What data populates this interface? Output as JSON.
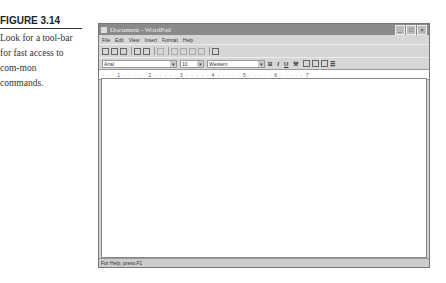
{
  "caption": {
    "title": "FIGURE 3.14",
    "text": "Look for a tool-bar for fast access to com-mon commands."
  },
  "window": {
    "title": "Document - WordPad",
    "controls": [
      "minimize",
      "maximize",
      "close"
    ],
    "menu": [
      "File",
      "Edit",
      "View",
      "Insert",
      "Format",
      "Help"
    ],
    "toolbar_icons": [
      "new-icon",
      "open-icon",
      "save-icon",
      "print-icon",
      "print-preview-icon",
      "find-icon",
      "cut-icon",
      "copy-icon",
      "paste-icon",
      "undo-icon",
      "date-time-icon"
    ],
    "format": {
      "font": "Arial",
      "size": "10",
      "script": "Western",
      "buttons": [
        "B",
        "I",
        "U",
        "⚒"
      ],
      "align": [
        "left",
        "center",
        "right"
      ],
      "bullets": "☰"
    },
    "ruler": "· · · 1 · · · · · 2 · · · · · 3 · · · · · 4 · · · · · 5 · · · · · 6 · · · · · 7",
    "status": "For Help, press F1"
  }
}
